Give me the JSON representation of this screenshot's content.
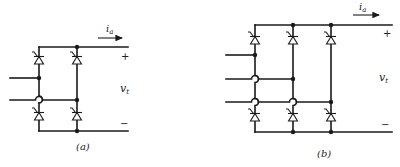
{
  "figure": {
    "panels": [
      {
        "id": "a",
        "caption": "(a)",
        "description": "Single-phase full-wave thyristor bridge",
        "current_label": "i",
        "current_subscript": "a",
        "voltage_label": "v",
        "voltage_subscript": "t",
        "plus_sign": "+",
        "minus_sign": "−",
        "thyristor_count": 4,
        "ac_inputs": 2
      },
      {
        "id": "b",
        "caption": "(b)",
        "description": "Three-phase full-wave thyristor bridge",
        "current_label": "i",
        "current_subscript": "a",
        "voltage_label": "v",
        "voltage_subscript": "t",
        "plus_sign": "+",
        "minus_sign": "−",
        "thyristor_count": 6,
        "ac_inputs": 3
      }
    ]
  },
  "colors": {
    "line": "#1a1a1a",
    "background": "#ffffff"
  }
}
